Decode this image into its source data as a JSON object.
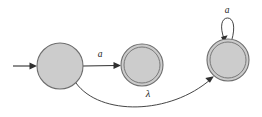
{
  "diagram": {
    "kind": "finite-automaton-state-diagram",
    "background_color": "#ffffff",
    "state_fill_color": "#cccccc",
    "state_stroke_color": "#6e6e6e",
    "edge_color": "#303030",
    "label_color": "#1a1a1a",
    "states": [
      {
        "id": "q0",
        "type": "start",
        "accepting": false,
        "cx": 60,
        "cy": 66,
        "r_outer": 23,
        "r_inner": 0
      },
      {
        "id": "q1",
        "type": "normal",
        "accepting": true,
        "cx": 142,
        "cy": 65,
        "r_outer": 21,
        "r_inner": 18
      },
      {
        "id": "q2",
        "type": "normal",
        "accepting": true,
        "cx": 228,
        "cy": 60,
        "r_outer": 21,
        "r_inner": 18
      }
    ],
    "start_arrow": {
      "from_x": 13,
      "to_x": 37,
      "y": 66
    },
    "transitions": [
      {
        "name": "q0-to-q1",
        "from": "q0",
        "to": "q1",
        "label": "a",
        "label_x": 100,
        "label_y": 55,
        "shape": "straight"
      },
      {
        "name": "q0-to-q2",
        "from": "q0",
        "to": "q2",
        "label": "λ",
        "label_x": 148,
        "label_y": 95,
        "shape": "curve-below"
      },
      {
        "name": "q2-self-loop",
        "from": "q2",
        "to": "q2",
        "label": "a",
        "label_x": 227,
        "label_y": 11,
        "shape": "self-loop-above"
      }
    ]
  }
}
